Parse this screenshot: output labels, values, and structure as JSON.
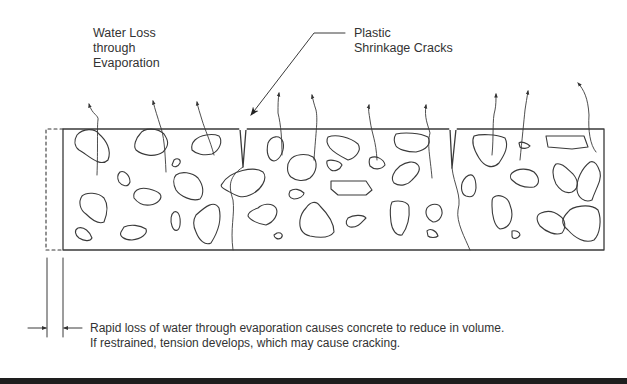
{
  "diagram": {
    "labels": {
      "water_loss": [
        "Water Loss",
        "through",
        "Evaporation"
      ],
      "cracks": [
        "Plastic",
        "Shrinkage Cracks"
      ]
    },
    "caption": [
      "Rapid loss of water through evaporation causes concrete to reduce in volume.",
      "If restrained, tension develops, which may cause cracking."
    ],
    "colors": {
      "line": "#3a3a3a",
      "bar": "#1e1e1e",
      "background": "#ffffff"
    }
  }
}
